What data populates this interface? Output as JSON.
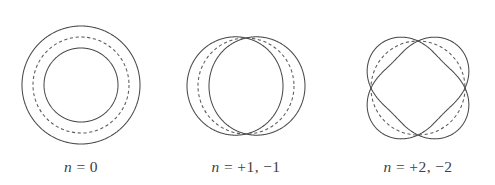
{
  "figure": {
    "background_color": "#ffffff",
    "stroke_color": "#4a4a4a",
    "dashed_stroke_color": "#5c5c5c",
    "label_color": "#3f3f3f",
    "panels": [
      {
        "id": "panel-n0",
        "label": "n = 0",
        "label_variable": "n",
        "label_rest": " = 0",
        "n_values": [
          0
        ],
        "nodes": 0,
        "center_x": 81,
        "center_y": 85,
        "orbit_radius": 48,
        "amplitude": 11,
        "label_x": 81,
        "label_y": 172
      },
      {
        "id": "panel-n1",
        "label": "n = +1, −1",
        "label_variable": "n",
        "label_rest": " = +1, −1",
        "n_values": [
          1,
          -1
        ],
        "nodes": 2,
        "center_x": 246,
        "center_y": 86,
        "orbit_radius": 48,
        "amplitude": 11,
        "label_x": 246,
        "label_y": 172
      },
      {
        "id": "panel-n2",
        "label": "n = +2, −2",
        "label_variable": "n",
        "label_rest": " = +2, −2",
        "n_values": [
          2,
          -2
        ],
        "nodes": 4,
        "center_x": 418,
        "center_y": 88,
        "orbit_radius": 47,
        "amplitude": 11,
        "phase_deg": 45,
        "label_x": 418,
        "label_y": 172
      }
    ]
  },
  "chart_data": {
    "type": "line",
    "xlabel": "θ (angle around orbit)",
    "ylabel": "radial displacement r + A cos(nθ)",
    "grid": false,
    "legend": "none",
    "series": [
      {
        "name": "n = 0",
        "n": 0,
        "nodes": 0,
        "radius": 48,
        "amplitude": 11,
        "formula": "r(θ) = 48 ± 11"
      },
      {
        "name": "n = +1, −1",
        "n": 1,
        "nodes": 2,
        "radius": 48,
        "amplitude": 11,
        "formula": "r(θ) = 48 + 11·cos(θ)"
      },
      {
        "name": "n = +2, −2",
        "n": 2,
        "nodes": 4,
        "radius": 47,
        "amplitude": 11,
        "formula": "r(θ) = 47 + 11·cos(2θ − 90°)"
      }
    ]
  }
}
